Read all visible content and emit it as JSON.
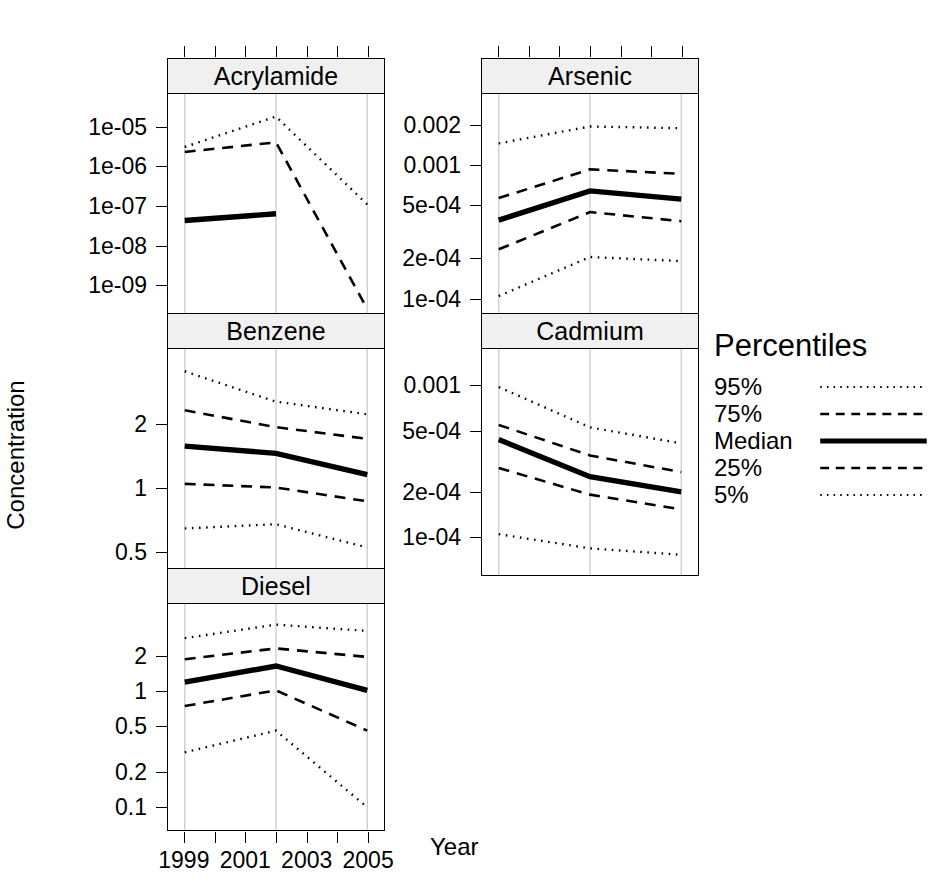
{
  "chart_data": {
    "type": "line",
    "title": "",
    "xlabel": "Year",
    "ylabel": "Concentration",
    "grid": true,
    "yscale": "log",
    "legend": {
      "title": "Percentiles",
      "position": "right",
      "entries": [
        {
          "label": "95%",
          "style": "dotted"
        },
        {
          "label": "75%",
          "style": "dashed"
        },
        {
          "label": "Median",
          "style": "solid-thick"
        },
        {
          "label": "25%",
          "style": "dashed"
        },
        {
          "label": "5%",
          "style": "dotted"
        }
      ]
    },
    "x": [
      1999,
      2002,
      2005
    ],
    "xticks": [
      1999,
      2000,
      2001,
      2002,
      2003,
      2004,
      2005
    ],
    "xticklabels": [
      "1999",
      "",
      "2001",
      "",
      "2003",
      "",
      "2005"
    ],
    "panels": [
      {
        "name": "Acrylamide",
        "yticks": [
          1e-05,
          1e-06,
          1e-07,
          1e-08,
          1e-09
        ],
        "yticklabels": [
          "1e-05",
          "1e-06",
          "1e-07",
          "1e-08",
          "1e-09"
        ],
        "ylim": [
          2e-10,
          4.5e-05
        ],
        "series": [
          {
            "name": "95%",
            "values": [
              3.2e-06,
              1.9e-05,
              1.1e-07
            ]
          },
          {
            "name": "75%",
            "values": [
              2.4e-06,
              4.2e-06,
              2.4e-10
            ]
          },
          {
            "name": "Median",
            "values": [
              4.3e-08,
              6.4e-08,
              null
            ]
          },
          {
            "name": "25%",
            "values": [
              null,
              null,
              null
            ]
          },
          {
            "name": "5%",
            "values": [
              null,
              null,
              null
            ]
          }
        ]
      },
      {
        "name": "Arsenic",
        "yticks": [
          0.002,
          0.001,
          0.0005,
          0.0002,
          0.0001
        ],
        "yticklabels": [
          "0.002",
          "0.001",
          "5e-04",
          "2e-04",
          "1e-04"
        ],
        "ylim": [
          7.8e-05,
          0.003
        ],
        "series": [
          {
            "name": "95%",
            "values": [
              0.00146,
              0.00196,
              0.0019
            ]
          },
          {
            "name": "75%",
            "values": [
              0.000565,
              0.00093,
              0.00086
            ]
          },
          {
            "name": "Median",
            "values": [
              0.000385,
              0.00064,
              0.000555
            ]
          },
          {
            "name": "25%",
            "values": [
              0.000232,
              0.000443,
              0.000378
            ]
          },
          {
            "name": "5%",
            "values": [
              0.000103,
              0.000203,
              0.000189
            ]
          }
        ]
      },
      {
        "name": "Benzene",
        "yticks": [
          2,
          1,
          0.5
        ],
        "yticklabels": [
          "2",
          "1",
          "0.5"
        ],
        "ylim": [
          0.42,
          4.15
        ],
        "series": [
          {
            "name": "95%",
            "values": [
              3.55,
              2.55,
              2.22
            ]
          },
          {
            "name": "75%",
            "values": [
              2.32,
              1.93,
              1.7
            ]
          },
          {
            "name": "Median",
            "values": [
              1.57,
              1.45,
              1.15
            ]
          },
          {
            "name": "25%",
            "values": [
              1.04,
              1.0,
              0.86
            ]
          },
          {
            "name": "5%",
            "values": [
              0.64,
              0.67,
              0.52
            ]
          }
        ]
      },
      {
        "name": "Cadmium",
        "yticks": [
          0.001,
          0.0005,
          0.0002,
          0.0001
        ],
        "yticklabels": [
          "0.001",
          "5e-04",
          "2e-04",
          "1e-04"
        ],
        "ylim": [
          6.3e-05,
          0.00155
        ],
        "series": [
          {
            "name": "95%",
            "values": [
              0.00098,
              0.00053,
              0.000415
            ]
          },
          {
            "name": "75%",
            "values": [
              0.00055,
              0.000345,
              0.000268
            ]
          },
          {
            "name": "Median",
            "values": [
              0.00044,
              0.00025,
              0.000198
            ]
          },
          {
            "name": "25%",
            "values": [
              0.000285,
              0.00019,
              0.000152
            ]
          },
          {
            "name": "5%",
            "values": [
              0.000104,
              8.38e-05,
              7.6e-05
            ]
          }
        ]
      },
      {
        "name": "Diesel",
        "yticks": [
          2,
          1,
          0.5,
          0.2,
          0.1
        ],
        "yticklabels": [
          "2",
          "1",
          "0.5",
          "0.2",
          "0.1"
        ],
        "ylim": [
          0.073,
          4.9
        ],
        "series": [
          {
            "name": "95%",
            "values": [
              2.9,
              3.8,
              3.35
            ]
          },
          {
            "name": "75%",
            "values": [
              1.9,
              2.36,
              1.99
            ]
          },
          {
            "name": "Median",
            "values": [
              1.2,
              1.66,
              1.02
            ]
          },
          {
            "name": "25%",
            "values": [
              0.745,
              1.02,
              0.455
            ]
          },
          {
            "name": "5%",
            "values": [
              0.295,
              0.455,
              0.098
            ]
          }
        ]
      }
    ]
  }
}
